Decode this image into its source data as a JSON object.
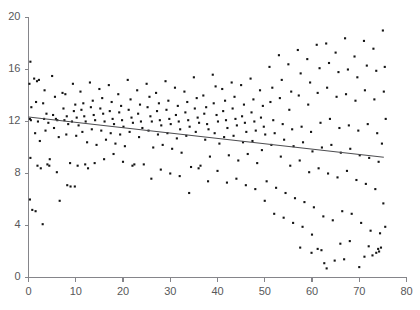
{
  "chart_data": {
    "type": "scatter",
    "title": "",
    "subtitle": "",
    "xlabel": "",
    "ylabel": "",
    "xlim": [
      0,
      80
    ],
    "ylim": [
      0,
      20
    ],
    "xticks": [
      0,
      10,
      20,
      30,
      40,
      50,
      60,
      70,
      80
    ],
    "yticks": [
      0,
      4,
      8,
      12,
      16,
      20
    ],
    "xtick_labels": [
      "0",
      "10",
      "20",
      "30",
      "40",
      "50",
      "60",
      "70",
      "80"
    ],
    "ytick_labels": [
      "0",
      "4",
      "8",
      "12",
      "16",
      "20"
    ],
    "grid": false,
    "legend": null,
    "marker": "square",
    "marker_size": 2.1,
    "marker_color": "#141414",
    "axis_color": "#85858a",
    "tick_label_color": "#58585a",
    "background_color": "#ffffff",
    "trendline": {
      "type": "linear-fit",
      "color": "#4d4d50",
      "x_start": 0.0,
      "y_start": 12.35,
      "x_end": 75.2,
      "y_end": 9.25,
      "slope": -0.0412,
      "intercept": 12.35
    },
    "points": [
      [
        0.4,
        16.6
      ],
      [
        0.2,
        14.9
      ],
      [
        0.6,
        13.1
      ],
      [
        0.3,
        12.2
      ],
      [
        0.5,
        12.1
      ],
      [
        0.4,
        9.2
      ],
      [
        0.3,
        6.0
      ],
      [
        0.8,
        5.2
      ],
      [
        1.5,
        5.1
      ],
      [
        1.2,
        15.3
      ],
      [
        1.8,
        15.1
      ],
      [
        2.2,
        15.2
      ],
      [
        1.6,
        13.5
      ],
      [
        2.0,
        12.0
      ],
      [
        1.4,
        11.1
      ],
      [
        2.4,
        10.5
      ],
      [
        1.9,
        8.6
      ],
      [
        2.6,
        8.4
      ],
      [
        3.0,
        4.1
      ],
      [
        3.4,
        14.4
      ],
      [
        3.1,
        13.4
      ],
      [
        3.8,
        12.6
      ],
      [
        3.3,
        12.2
      ],
      [
        4.2,
        11.9
      ],
      [
        3.6,
        11.3
      ],
      [
        4.5,
        9.1
      ],
      [
        4.0,
        8.7
      ],
      [
        4.4,
        8.6
      ],
      [
        5.0,
        15.5
      ],
      [
        5.6,
        13.9
      ],
      [
        5.2,
        12.5
      ],
      [
        5.8,
        12.2
      ],
      [
        6.1,
        12.1
      ],
      [
        5.4,
        11.5
      ],
      [
        6.4,
        10.8
      ],
      [
        6.0,
        8.1
      ],
      [
        6.6,
        5.9
      ],
      [
        7.2,
        14.2
      ],
      [
        7.8,
        14.1
      ],
      [
        7.4,
        13.0
      ],
      [
        8.1,
        12.4
      ],
      [
        7.6,
        12.1
      ],
      [
        8.4,
        11.8
      ],
      [
        8.0,
        11.0
      ],
      [
        8.8,
        8.8
      ],
      [
        8.2,
        7.1
      ],
      [
        8.9,
        7.0
      ],
      [
        9.4,
        14.9
      ],
      [
        9.9,
        13.3
      ],
      [
        9.6,
        12.8
      ],
      [
        10.2,
        12.3
      ],
      [
        9.2,
        12.0
      ],
      [
        10.6,
        11.7
      ],
      [
        10.1,
        10.9
      ],
      [
        10.4,
        8.6
      ],
      [
        9.8,
        7.0
      ],
      [
        11.0,
        14.3
      ],
      [
        11.6,
        13.4
      ],
      [
        11.2,
        12.9
      ],
      [
        11.8,
        12.4
      ],
      [
        12.1,
        12.0
      ],
      [
        11.4,
        11.2
      ],
      [
        12.4,
        10.4
      ],
      [
        12.0,
        8.7
      ],
      [
        12.6,
        8.4
      ],
      [
        13.0,
        15.0
      ],
      [
        13.6,
        13.6
      ],
      [
        13.2,
        13.1
      ],
      [
        13.8,
        12.5
      ],
      [
        14.1,
        12.1
      ],
      [
        13.4,
        11.4
      ],
      [
        14.4,
        10.2
      ],
      [
        14.0,
        8.8
      ],
      [
        15.0,
        14.5
      ],
      [
        15.6,
        13.8
      ],
      [
        15.2,
        13.0
      ],
      [
        15.8,
        12.6
      ],
      [
        16.1,
        12.0
      ],
      [
        15.4,
        11.3
      ],
      [
        16.4,
        10.6
      ],
      [
        16.0,
        9.1
      ],
      [
        17.0,
        14.8
      ],
      [
        17.6,
        13.5
      ],
      [
        17.2,
        12.8
      ],
      [
        17.8,
        12.2
      ],
      [
        18.1,
        11.8
      ],
      [
        17.4,
        11.1
      ],
      [
        18.4,
        10.3
      ],
      [
        18.0,
        9.5
      ],
      [
        19.0,
        14.1
      ],
      [
        19.6,
        13.2
      ],
      [
        19.2,
        12.7
      ],
      [
        19.8,
        12.1
      ],
      [
        20.1,
        11.6
      ],
      [
        19.4,
        11.0
      ],
      [
        20.4,
        10.1
      ],
      [
        20.0,
        8.9
      ],
      [
        21.0,
        15.2
      ],
      [
        21.6,
        13.7
      ],
      [
        21.2,
        12.9
      ],
      [
        21.8,
        12.3
      ],
      [
        22.1,
        11.9
      ],
      [
        21.4,
        11.2
      ],
      [
        22.4,
        8.7
      ],
      [
        22.0,
        8.6
      ],
      [
        23.0,
        14.4
      ],
      [
        23.6,
        13.3
      ],
      [
        23.2,
        12.6
      ],
      [
        23.8,
        12.0
      ],
      [
        24.1,
        11.5
      ],
      [
        23.4,
        10.8
      ],
      [
        24.4,
        8.7
      ],
      [
        25.0,
        14.9
      ],
      [
        25.6,
        13.9
      ],
      [
        25.2,
        13.1
      ],
      [
        25.8,
        12.4
      ],
      [
        26.1,
        12.0
      ],
      [
        25.4,
        11.3
      ],
      [
        26.4,
        10.0
      ],
      [
        26.0,
        7.6
      ],
      [
        27.0,
        14.2
      ],
      [
        27.6,
        13.4
      ],
      [
        27.2,
        12.8
      ],
      [
        27.8,
        12.1
      ],
      [
        28.1,
        11.7
      ],
      [
        27.4,
        11.0
      ],
      [
        28.4,
        10.2
      ],
      [
        28.0,
        8.3
      ],
      [
        29.0,
        15.1
      ],
      [
        29.6,
        13.6
      ],
      [
        29.2,
        12.9
      ],
      [
        29.8,
        12.2
      ],
      [
        30.1,
        11.8
      ],
      [
        29.4,
        11.1
      ],
      [
        30.4,
        9.9
      ],
      [
        30.0,
        8.0
      ],
      [
        31.0,
        14.6
      ],
      [
        31.6,
        13.2
      ],
      [
        31.2,
        12.5
      ],
      [
        31.8,
        12.0
      ],
      [
        32.1,
        11.4
      ],
      [
        31.4,
        10.7
      ],
      [
        32.4,
        9.6
      ],
      [
        32.0,
        7.8
      ],
      [
        33.0,
        14.3
      ],
      [
        33.6,
        13.5
      ],
      [
        33.2,
        12.7
      ],
      [
        33.8,
        12.1
      ],
      [
        34.1,
        11.6
      ],
      [
        33.4,
        10.9
      ],
      [
        34.4,
        8.5
      ],
      [
        34.0,
        6.5
      ],
      [
        35.0,
        15.4
      ],
      [
        35.6,
        13.8
      ],
      [
        35.2,
        13.0
      ],
      [
        35.8,
        12.3
      ],
      [
        36.1,
        11.9
      ],
      [
        35.4,
        11.2
      ],
      [
        36.4,
        8.6
      ],
      [
        36.0,
        8.4
      ],
      [
        37.0,
        14.0
      ],
      [
        37.6,
        13.1
      ],
      [
        37.2,
        12.6
      ],
      [
        37.8,
        11.8
      ],
      [
        38.1,
        11.4
      ],
      [
        37.4,
        10.6
      ],
      [
        38.4,
        9.3
      ],
      [
        38.0,
        7.4
      ],
      [
        39.0,
        15.6
      ],
      [
        39.6,
        14.7
      ],
      [
        39.2,
        13.4
      ],
      [
        39.8,
        12.5
      ],
      [
        40.1,
        12.0
      ],
      [
        39.4,
        11.1
      ],
      [
        40.4,
        10.3
      ],
      [
        40.0,
        8.2
      ],
      [
        41.0,
        14.5
      ],
      [
        41.6,
        13.6
      ],
      [
        41.2,
        12.8
      ],
      [
        41.8,
        12.1
      ],
      [
        42.1,
        11.5
      ],
      [
        41.4,
        10.8
      ],
      [
        42.4,
        9.4
      ],
      [
        42.0,
        7.3
      ],
      [
        43.0,
        15.0
      ],
      [
        43.6,
        13.9
      ],
      [
        43.2,
        13.0
      ],
      [
        43.8,
        12.2
      ],
      [
        44.1,
        11.7
      ],
      [
        43.4,
        10.9
      ],
      [
        44.4,
        9.0
      ],
      [
        44.0,
        7.6
      ],
      [
        45.0,
        14.8
      ],
      [
        45.6,
        13.3
      ],
      [
        45.2,
        12.4
      ],
      [
        45.8,
        11.9
      ],
      [
        46.1,
        11.2
      ],
      [
        45.4,
        10.4
      ],
      [
        46.4,
        9.5
      ],
      [
        46.0,
        7.1
      ],
      [
        47.0,
        15.3
      ],
      [
        47.6,
        13.7
      ],
      [
        47.2,
        12.7
      ],
      [
        47.8,
        12.0
      ],
      [
        48.1,
        11.3
      ],
      [
        47.4,
        10.5
      ],
      [
        48.4,
        8.8
      ],
      [
        48.0,
        6.8
      ],
      [
        49.0,
        14.4
      ],
      [
        49.6,
        13.2
      ],
      [
        49.2,
        12.3
      ],
      [
        49.8,
        11.6
      ],
      [
        50.1,
        11.0
      ],
      [
        49.4,
        9.8
      ],
      [
        50.4,
        7.4
      ],
      [
        50.0,
        5.9
      ],
      [
        51.0,
        16.2
      ],
      [
        51.6,
        14.6
      ],
      [
        51.2,
        13.5
      ],
      [
        51.8,
        12.1
      ],
      [
        52.1,
        11.1
      ],
      [
        51.4,
        10.2
      ],
      [
        52.4,
        6.9
      ],
      [
        52.0,
        4.9
      ],
      [
        53.0,
        17.1
      ],
      [
        53.6,
        15.2
      ],
      [
        53.2,
        13.8
      ],
      [
        53.8,
        11.8
      ],
      [
        54.1,
        10.6
      ],
      [
        53.4,
        9.3
      ],
      [
        54.4,
        6.5
      ],
      [
        54.0,
        4.6
      ],
      [
        55.0,
        16.4
      ],
      [
        55.6,
        14.3
      ],
      [
        55.2,
        12.9
      ],
      [
        55.8,
        11.4
      ],
      [
        56.1,
        10.1
      ],
      [
        55.4,
        8.6
      ],
      [
        56.4,
        6.1
      ],
      [
        56.0,
        4.2
      ],
      [
        57.0,
        17.5
      ],
      [
        57.6,
        15.7
      ],
      [
        57.2,
        14.0
      ],
      [
        57.8,
        11.6
      ],
      [
        58.1,
        10.4
      ],
      [
        57.4,
        9.0
      ],
      [
        58.4,
        5.8
      ],
      [
        58.0,
        3.9
      ],
      [
        59.0,
        16.8
      ],
      [
        59.6,
        15.0
      ],
      [
        59.2,
        13.3
      ],
      [
        59.8,
        11.2
      ],
      [
        60.1,
        9.7
      ],
      [
        59.4,
        8.1
      ],
      [
        60.4,
        5.4
      ],
      [
        60.0,
        3.3
      ],
      [
        61.0,
        17.9
      ],
      [
        61.6,
        16.1
      ],
      [
        61.2,
        14.2
      ],
      [
        61.8,
        11.9
      ],
      [
        62.1,
        10.0
      ],
      [
        61.4,
        8.4
      ],
      [
        62.4,
        4.7
      ],
      [
        62.0,
        2.1
      ],
      [
        63.0,
        18.0
      ],
      [
        63.6,
        16.5
      ],
      [
        63.2,
        14.6
      ],
      [
        63.8,
        12.2
      ],
      [
        64.1,
        10.2
      ],
      [
        63.4,
        8.0
      ],
      [
        64.4,
        4.4
      ],
      [
        63.1,
        0.7
      ],
      [
        65.0,
        17.3
      ],
      [
        65.6,
        15.8
      ],
      [
        65.2,
        13.9
      ],
      [
        65.8,
        11.5
      ],
      [
        66.1,
        9.6
      ],
      [
        65.4,
        7.7
      ],
      [
        66.4,
        5.1
      ],
      [
        66.0,
        2.6
      ],
      [
        67.0,
        18.4
      ],
      [
        67.6,
        16.0
      ],
      [
        67.2,
        14.1
      ],
      [
        67.8,
        11.7
      ],
      [
        68.1,
        9.9
      ],
      [
        67.4,
        8.2
      ],
      [
        68.4,
        4.9
      ],
      [
        68.0,
        2.8
      ],
      [
        69.0,
        17.0
      ],
      [
        69.6,
        15.4
      ],
      [
        69.2,
        13.6
      ],
      [
        69.8,
        11.3
      ],
      [
        70.1,
        9.4
      ],
      [
        69.4,
        7.5
      ],
      [
        70.4,
        4.2
      ],
      [
        70.0,
        0.8
      ],
      [
        71.0,
        18.2
      ],
      [
        71.6,
        16.3
      ],
      [
        71.2,
        14.4
      ],
      [
        71.8,
        11.8
      ],
      [
        72.1,
        9.2
      ],
      [
        71.4,
        7.2
      ],
      [
        72.4,
        3.6
      ],
      [
        72.0,
        2.4
      ],
      [
        73.0,
        17.6
      ],
      [
        73.6,
        15.9
      ],
      [
        73.2,
        13.7
      ],
      [
        73.8,
        11.1
      ],
      [
        74.1,
        8.9
      ],
      [
        73.4,
        6.8
      ],
      [
        74.4,
        3.4
      ],
      [
        74.0,
        2.2
      ],
      [
        75.0,
        19.0
      ],
      [
        75.4,
        16.2
      ],
      [
        75.2,
        14.3
      ],
      [
        75.6,
        12.2
      ],
      [
        74.8,
        10.3
      ],
      [
        75.1,
        5.7
      ],
      [
        75.5,
        3.9
      ],
      [
        74.6,
        2.3
      ],
      [
        62.6,
        1.1
      ],
      [
        64.8,
        1.3
      ],
      [
        66.8,
        1.4
      ],
      [
        71.1,
        1.6
      ],
      [
        72.8,
        1.7
      ],
      [
        73.6,
        1.9
      ],
      [
        74.2,
        2.0
      ],
      [
        59.9,
        1.9
      ],
      [
        61.2,
        2.2
      ],
      [
        57.5,
        2.3
      ]
    ]
  }
}
